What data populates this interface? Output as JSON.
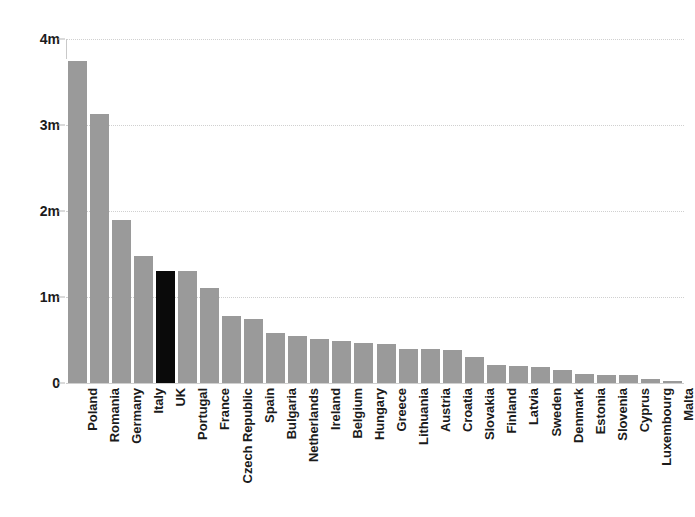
{
  "chart_data": {
    "type": "bar",
    "title": "",
    "subtitle": "",
    "xlabel": "",
    "ylabel": "",
    "ylim": [
      0,
      4000000
    ],
    "grid": true,
    "legend": false,
    "y_ticks": [
      {
        "value": 4000000,
        "label": "4m"
      },
      {
        "value": 3000000,
        "label": "3m"
      },
      {
        "value": 2000000,
        "label": "2m"
      },
      {
        "value": 1000000,
        "label": "1m"
      },
      {
        "value": 0,
        "label": "0"
      }
    ],
    "categories": [
      "Poland",
      "Romania",
      "Germany",
      "Italy",
      "UK",
      "Portugal",
      "France",
      "Czech Republic",
      "Spain",
      "Bulgaria",
      "Netherlands",
      "Ireland",
      "Belgium",
      "Hungary",
      "Greece",
      "Lithuania",
      "Austria",
      "Croatia",
      "Slovakia",
      "Finland",
      "Latvia",
      "Sweden",
      "Denmark",
      "Estonia",
      "Slovenia",
      "Cyprus",
      "Luxembourg",
      "Malta"
    ],
    "values": [
      3750000,
      3130000,
      1890000,
      1480000,
      1300000,
      1300000,
      1110000,
      780000,
      740000,
      580000,
      550000,
      510000,
      490000,
      460000,
      450000,
      400000,
      390000,
      380000,
      300000,
      210000,
      200000,
      190000,
      150000,
      100000,
      95000,
      95000,
      50000,
      20000
    ],
    "highlight_category": "UK",
    "colors": {
      "bar": "#9a9a9a",
      "bar_highlight": "#0a0a0a",
      "gridline": "#d0d0d0",
      "axis": "#c9c9c9",
      "text": "#1b1b1b",
      "background": "#ffffff"
    }
  }
}
